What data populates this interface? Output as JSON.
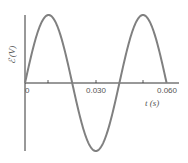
{
  "chart_data": {
    "type": "line",
    "title": "",
    "xlabel": "t (s)",
    "ylabel": "ℰ (V)",
    "x_tick_labels": [
      "0",
      "0.030",
      "0.060"
    ],
    "x_ticks": [
      0,
      0.01,
      0.02,
      0.03,
      0.04,
      0.05,
      0.06
    ],
    "xlim": [
      0,
      0.062
    ],
    "ylim": [
      -1,
      1
    ],
    "grid": false,
    "legend": null,
    "series": [
      {
        "name": "emf",
        "description": "sinusoid, amplitude 1 (unlabeled), period 0.040 s",
        "x": [
          0,
          0.01,
          0.02,
          0.03,
          0.04,
          0.05,
          0.06
        ],
        "values": [
          0,
          1,
          0,
          -1,
          0,
          1,
          0
        ],
        "color": "#808080"
      }
    ]
  },
  "labels": {
    "x0": "0",
    "x1": "0.030",
    "x2": "0.060",
    "xaxis": "t (s)",
    "yaxis": "ℰ (V)"
  },
  "colors": {
    "curve": "#808080",
    "axis": "#333333"
  }
}
